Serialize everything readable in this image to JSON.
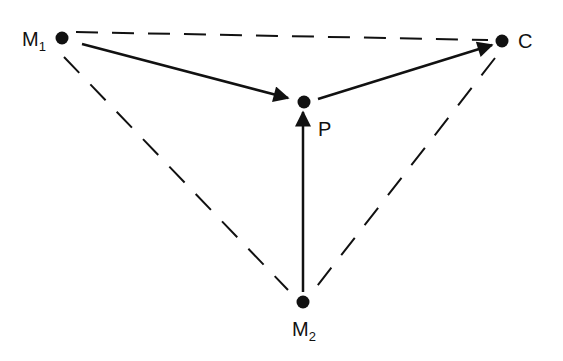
{
  "diagram": {
    "nodes": {
      "m1": {
        "label": "M",
        "sub": "1"
      },
      "c": {
        "label": "C"
      },
      "p": {
        "label": "P"
      },
      "m2": {
        "label": "M",
        "sub": "2"
      }
    },
    "edges": [
      {
        "from": "M1",
        "to": "P",
        "style": "solid-arrow"
      },
      {
        "from": "P",
        "to": "C",
        "style": "solid-arrow"
      },
      {
        "from": "M2",
        "to": "P",
        "style": "solid-arrow"
      },
      {
        "from": "M1",
        "to": "C",
        "style": "dashed"
      },
      {
        "from": "M1",
        "to": "M2",
        "style": "dashed"
      },
      {
        "from": "C",
        "to": "M2",
        "style": "dashed"
      }
    ],
    "colors": {
      "ink": "#111111",
      "background": "#ffffff"
    }
  }
}
